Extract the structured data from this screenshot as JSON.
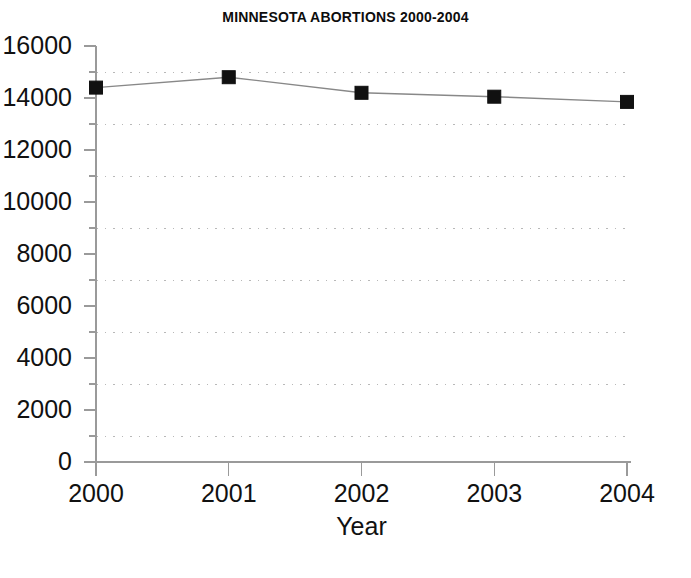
{
  "chart_data": {
    "type": "line",
    "title": "MINNESOTA ABORTIONS 2000-2004",
    "xlabel": "Year",
    "ylabel": "",
    "categories": [
      "2000",
      "2001",
      "2002",
      "2003",
      "2004"
    ],
    "x": [
      2000,
      2001,
      2002,
      2003,
      2004
    ],
    "values": [
      14400,
      14800,
      14200,
      14050,
      13850
    ],
    "series": [
      {
        "name": "Abortions",
        "values": [
          14400,
          14800,
          14200,
          14050,
          13850
        ]
      }
    ],
    "ylim": [
      0,
      16000
    ],
    "xlim": [
      2000,
      2004
    ],
    "y_major_ticks": [
      0,
      2000,
      4000,
      6000,
      8000,
      10000,
      12000,
      14000,
      16000
    ],
    "y_tick_labels": [
      "0",
      "2000",
      "4000",
      "6000",
      "8000",
      "10000",
      "12000",
      "14000",
      "16000"
    ],
    "y_minor_ticks": [
      1000,
      3000,
      5000,
      7000,
      9000,
      11000,
      13000,
      15000
    ],
    "gridlines": [
      1000,
      3000,
      5000,
      7000,
      9000,
      11000,
      13000,
      15000
    ],
    "grid": "horizontal-dotted",
    "legend": "none",
    "marker": "filled-square",
    "marker_color": "#111111",
    "line_color": "#888888",
    "axis_color": "#9a9a9a",
    "grid_color": "#b8b8b8",
    "background": "#ffffff"
  }
}
